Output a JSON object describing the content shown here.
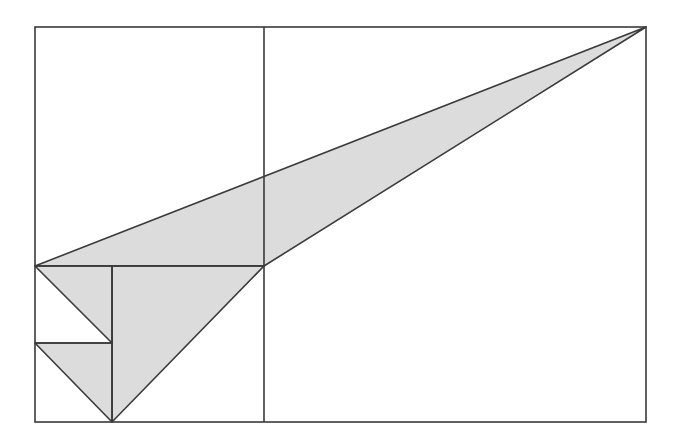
{
  "canvas": {
    "width": 679,
    "height": 441,
    "background": "#ffffff"
  },
  "colors": {
    "stroke": "#3a3a3a",
    "fill": "#dcdcdc"
  },
  "stroke_width": 1.6,
  "outer_rect": {
    "x": 35,
    "y": 27,
    "width": 611,
    "height": 395
  },
  "lines": [
    {
      "name": "divider-vertical",
      "x1": 264,
      "y1": 27,
      "x2": 264,
      "y2": 422
    },
    {
      "name": "inner-vertical",
      "x1": 112,
      "y1": 266,
      "x2": 112,
      "y2": 422
    },
    {
      "name": "horizontal-main",
      "x1": 35,
      "y1": 266,
      "x2": 264,
      "y2": 266
    },
    {
      "name": "horizontal-small",
      "x1": 35,
      "y1": 343,
      "x2": 112,
      "y2": 343
    }
  ],
  "triangles": [
    {
      "name": "large-triangle",
      "points": "35,266 646,27 264,266"
    },
    {
      "name": "medium-triangle",
      "points": "112,266 264,266 112,422"
    },
    {
      "name": "upper-small-triangle",
      "points": "35,266 112,266 112,343"
    },
    {
      "name": "lower-small-triangle",
      "points": "35,343 112,343 112,422"
    }
  ]
}
